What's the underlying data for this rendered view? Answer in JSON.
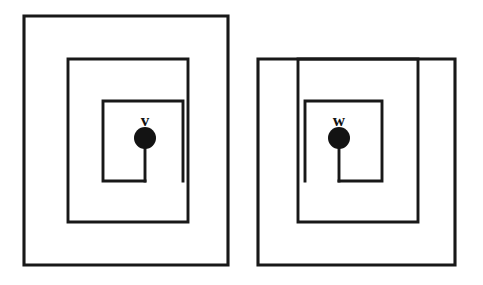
{
  "figure": {
    "canvas": {
      "width": 483,
      "height": 285,
      "background": "#ffffff"
    },
    "stroke_color": "#181818",
    "dot_color": "#131313",
    "label_color": "#111111"
  },
  "groups": [
    {
      "id": "left-group",
      "label": "v",
      "orientation": "open-bottom-right",
      "outer_rect": {
        "x": 24,
        "y": 16,
        "width": 204,
        "height": 249
      },
      "middle_rect": {
        "x": 68,
        "y": 59,
        "width": 120,
        "height": 163
      },
      "inner_open_rect": {
        "x": 103,
        "y": 101,
        "width": 80,
        "height": 80
      },
      "stem": {
        "x": 145,
        "y_top": 138,
        "y_bottom": 181
      },
      "dot": {
        "cx": 145,
        "cy": 138,
        "r": 11
      },
      "label_pos": {
        "x": 145,
        "y": 126
      }
    },
    {
      "id": "right-group",
      "label": "w",
      "orientation": "open-bottom-left",
      "outer_rect": {
        "x": 258,
        "y": 59,
        "width": 197,
        "height": 206
      },
      "middle_rect": {
        "x": 258,
        "y": 59,
        "width": 160,
        "height": 163
      },
      "inner_open_rect": {
        "x": 305,
        "y": 101,
        "width": 77,
        "height": 80
      },
      "stem": {
        "x": 339,
        "y_top": 138,
        "y_bottom": 181
      },
      "dot": {
        "cx": 339,
        "cy": 138,
        "r": 11
      },
      "label_pos": {
        "x": 339,
        "y": 126
      }
    }
  ],
  "paths": {
    "left_outer": "M 24 265 L 24 16 L 228 16 L 228 265 L 24 265 Z",
    "left_middle": "M 68 222 L 68 59 L 188 59 L 188 222 L 68 222 Z",
    "left_inner_open": "M 183 181 L 183 101 L 103 101 L 103 181 L 145 181",
    "left_stem": "M 145 181 L 145 138",
    "right_outer": "M 455 265 L 258 265 L 258 59 L 455 59 L 455 265 Z",
    "right_middle": "M 418 222 L 298 222 L 298 59 L 418 59 L 418 222 Z",
    "right_inner_open": "M 305 181 L 305 101 L 382 101 L 382 181 L 339 181",
    "right_stem": "M 339 181 L 339 138"
  }
}
